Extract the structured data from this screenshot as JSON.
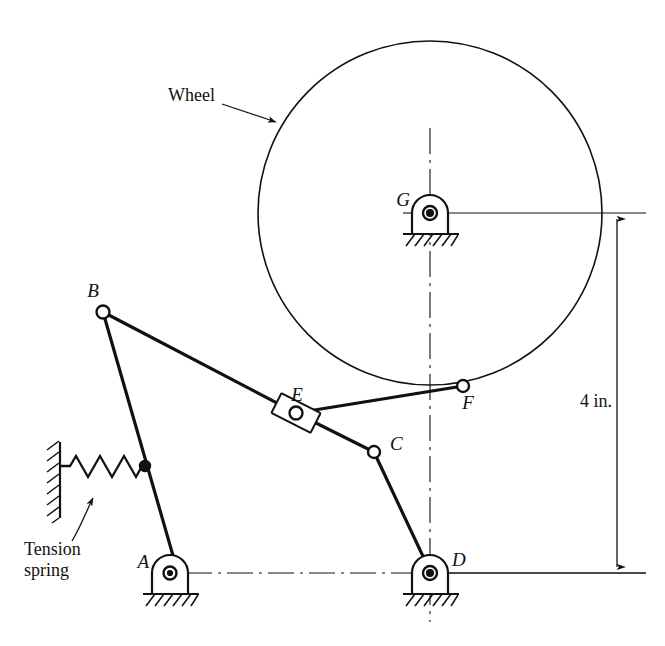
{
  "figure": {
    "background_color": "#ffffff",
    "line_color": "#111111"
  },
  "annotations": {
    "wheel_label": "Wheel",
    "tension_label": "Tension",
    "spring_label": "spring",
    "dimension_label": "4 in."
  },
  "points": {
    "A": {
      "label": "A",
      "x": 170,
      "y": 573,
      "type": "ground-pivot"
    },
    "B": {
      "label": "B",
      "x": 103,
      "y": 312,
      "type": "open-joint"
    },
    "C": {
      "label": "C",
      "x": 374,
      "y": 452,
      "type": "open-joint"
    },
    "D": {
      "label": "D",
      "x": 430,
      "y": 573,
      "type": "ground-pivot"
    },
    "E": {
      "label": "E",
      "x": 296,
      "y": 413,
      "type": "slider-joint"
    },
    "F": {
      "label": "F",
      "x": 463,
      "y": 386,
      "type": "open-joint"
    },
    "G": {
      "label": "G",
      "x": 430,
      "y": 213,
      "type": "ground-pivot"
    }
  },
  "wheel": {
    "center_x": 430,
    "center_y": 213,
    "radius": 172
  },
  "links": [
    {
      "name": "link-B-A",
      "from": "B",
      "to": "A"
    },
    {
      "name": "link-B-E",
      "from": "B",
      "to": "E"
    },
    {
      "name": "link-E-F",
      "from": "E",
      "to": "F"
    },
    {
      "name": "link-E-C",
      "from": "E",
      "to": "C"
    },
    {
      "name": "link-C-D",
      "from": "C",
      "to": "D"
    }
  ],
  "spring": {
    "name": "tension-spring",
    "wall_x": 60,
    "wall_top": 443,
    "wall_bottom": 517,
    "anchor_x": 145,
    "anchor_y": 466,
    "coils": 7
  },
  "dimension": {
    "value": "4 in.",
    "line_x": 617,
    "top_y": 219,
    "bottom_y": 573,
    "text_x": 617,
    "text_y": 400
  },
  "centerlines": {
    "vertical_x": 430,
    "vertical_top": 128,
    "vertical_bottom": 622,
    "horizontal_y": 573,
    "horizontal_left": 185,
    "horizontal_right": 418
  }
}
